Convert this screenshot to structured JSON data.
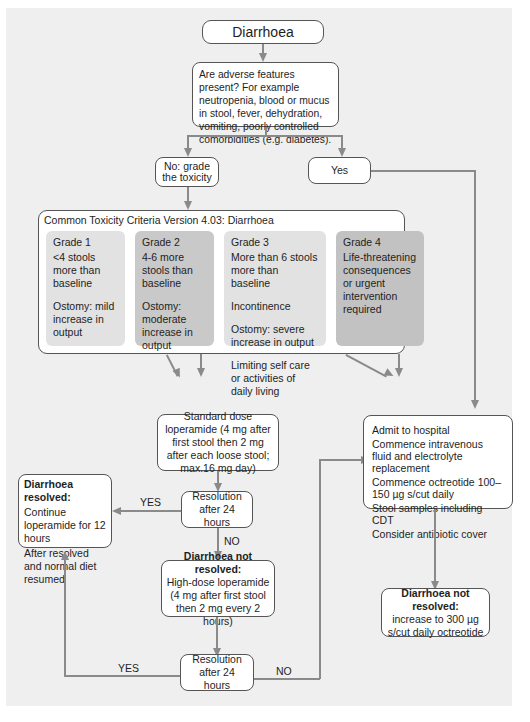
{
  "diagram": {
    "start": {
      "label": "Diarrhoea"
    },
    "question": {
      "text": "Are adverse features present? For example neutropenia, blood or mucus in stool, fever, dehydration, vomiting, poorly controlled comorbidities (e.g. diabetes)."
    },
    "branch_no": {
      "label": "No: grade the toxicity"
    },
    "branch_yes": {
      "label": "Yes"
    },
    "ctc": {
      "title": "Common Toxicity Criteria Version 4.03: Diarrhoea",
      "grades": [
        {
          "title": "Grade 1",
          "items": [
            "<4 stools more than baseline",
            "Ostomy: mild increase in output"
          ],
          "color": "#e2e2e2"
        },
        {
          "title": "Grade 2",
          "items": [
            "4-6 more stools than baseline",
            "Ostomy: moderate increase in output"
          ],
          "color": "#c9c9c9"
        },
        {
          "title": "Grade 3",
          "items": [
            "More than 6 stools more than baseline",
            "Incontinence",
            "Ostomy: severe increase in output",
            "Limiting self care or activities of daily living"
          ],
          "color": "#e2e2e2"
        },
        {
          "title": "Grade 4",
          "items": [
            "Life-threatening consequences or urgent intervention required"
          ],
          "color": "#c2c2c2"
        }
      ]
    },
    "standard_dose": {
      "text": "Standard dose loperamide (4 mg after first stool then 2 mg after each loose stool; max.16 mg day)"
    },
    "resolution1": {
      "text": "Resolution after 24 hours"
    },
    "resolved": {
      "title": "Diarrhoea resolved:",
      "lines": [
        "Continue loperamide for 12 hours",
        "After resolved and normal diet resumed"
      ]
    },
    "high_dose": {
      "title": "Diarrhoea not resolved:",
      "text": "High-dose loperamide (4 mg after first stool then 2 mg every 2 hours)"
    },
    "resolution2": {
      "text": "Resolution after 24 hours"
    },
    "hospital": {
      "lines": [
        "Admit to hospital",
        "Commence intravenous fluid and electrolyte replacement",
        "Commence octreotide 100–150 µg s/cut daily",
        "Stool samples including CDT",
        "Consider antibiotic cover"
      ]
    },
    "octreotide": {
      "title": "Diarrhoea not resolved:",
      "text": "increase to 300 µg s/cut daily octreotide"
    },
    "edge_labels": {
      "yes1": "YES",
      "no1": "NO",
      "yes2": "YES",
      "no2": "NO"
    }
  }
}
